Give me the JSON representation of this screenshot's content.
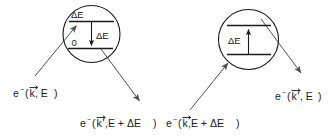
{
  "figure": {
    "background_color": "#ffffff",
    "line_color": "#1a1a1a",
    "beam_color": "#4f4f4f",
    "width": 328,
    "height": 138
  },
  "process_left": {
    "name": "energy-loss-process",
    "blob_label": "scattering-region",
    "levels": {
      "upper_label": "ΔE",
      "lower_label": "0"
    },
    "transition": {
      "direction": "down",
      "label": "ΔE"
    },
    "incoming": {
      "electron": "e",
      "charge": "−",
      "open_paren": "(",
      "momentum": "k",
      "prime": "",
      "energy": ", E",
      "close_paren": ")",
      "full_text": "e⁻(k⃗, E)"
    },
    "outgoing": {
      "electron": "e",
      "charge": "−",
      "open_paren": "(",
      "momentum": "k",
      "prime": "'",
      "energy": ",E + ΔE",
      "close_paren": ")",
      "full_text": "e⁻(k⃗',E + ΔE)"
    }
  },
  "process_right": {
    "name": "energy-gain-process",
    "blob_label": "scattering-region",
    "levels": {
      "upper_label": "",
      "lower_label": ""
    },
    "transition": {
      "direction": "up",
      "label": "ΔE"
    },
    "incoming": {
      "electron": "e",
      "charge": "−",
      "open_paren": "(",
      "momentum": "k",
      "prime": "",
      "energy": ",E + ΔE",
      "close_paren": ")",
      "full_text": "e⁻(k⃗,E + ΔE)"
    },
    "outgoing": {
      "electron": "e",
      "charge": "−",
      "open_paren": "(",
      "momentum": "k",
      "prime": "'",
      "energy": ", E",
      "close_paren": ")",
      "full_text": "e⁻(k⃗', E)"
    }
  }
}
